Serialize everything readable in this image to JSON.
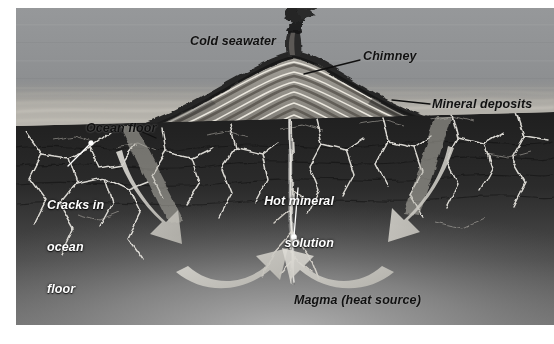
{
  "figure": {
    "kind": "cross-section-diagram",
    "background_color": "#8d8d8d",
    "page_color": "#ffffff"
  },
  "palette": {
    "seawater": "#8f9092",
    "seawater_deep": "#77797c",
    "seafloor_light": "#b9b7b2",
    "rock_dark": "#2c2c2c",
    "rock_mid": "#4a4a4a",
    "magma_glow": "#8a8a8a",
    "crack_white": "#e8e8e4",
    "arrow_fill": "#cfcfca",
    "chimney_smoke": "#1b1b1b",
    "label_dark": "#111111",
    "label_light": "#ffffff"
  },
  "labels": [
    {
      "id": "cold-seawater",
      "text": "Cold seawater",
      "color": "dark",
      "leader": false,
      "lines": [
        "Cold seawater"
      ]
    },
    {
      "id": "chimney",
      "text": "Chimney",
      "color": "dark",
      "leader": true,
      "lines": [
        "Chimney"
      ]
    },
    {
      "id": "mineral-deposits",
      "text": "Mineral deposits",
      "color": "dark",
      "leader": true,
      "lines": [
        "Mineral deposits"
      ]
    },
    {
      "id": "ocean-floor",
      "text": "Ocean floor",
      "color": "dark",
      "leader": true,
      "lines": [
        "Ocean floor"
      ]
    },
    {
      "id": "cracks-in-ocean-floor",
      "text": "Cracks in ocean floor",
      "color": "light",
      "leader": true,
      "lines": [
        "Cracks in",
        "ocean",
        "floor"
      ]
    },
    {
      "id": "hot-mineral-solution",
      "text": "Hot mineral solution",
      "color": "light",
      "leader": true,
      "lines": [
        "Hot mineral",
        "solution"
      ]
    },
    {
      "id": "magma-heat-source",
      "text": "Magma (heat source)",
      "color": "dark",
      "leader": false,
      "lines": [
        "Magma (heat source)"
      ]
    }
  ],
  "label_text": {
    "cold_seawater": "Cold seawater",
    "chimney": "Chimney",
    "mineral_deposits": "Mineral deposits",
    "ocean_floor": "Ocean floor",
    "cracks_line1": "Cracks in",
    "cracks_line2": "ocean",
    "cracks_line3": "floor",
    "hot_mineral_line1": "Hot mineral",
    "hot_mineral_line2": "solution",
    "magma": "Magma (heat source)"
  },
  "flow_arrows": [
    {
      "id": "left-downflow",
      "description": "cold seawater descends into cracks on the left",
      "direction": "down-right"
    },
    {
      "id": "left-upflow",
      "description": "heated solution curves up toward the central vent from the left",
      "direction": "up-right"
    },
    {
      "id": "right-downflow",
      "description": "cold seawater descends into cracks on the right",
      "direction": "down-left"
    },
    {
      "id": "right-upflow",
      "description": "heated solution curves up toward the central vent from the right",
      "direction": "up-left"
    }
  ],
  "features": [
    {
      "id": "smoke-plume",
      "name": "black smoker plume"
    },
    {
      "id": "chimney-stack",
      "name": "chimney stack"
    },
    {
      "id": "vent-mound",
      "name": "layered mineral deposit mound"
    },
    {
      "id": "ocean-floor-surface",
      "name": "ocean floor surface"
    },
    {
      "id": "crust-rock",
      "name": "fractured crustal rock"
    },
    {
      "id": "magma-chamber",
      "name": "magma heat source"
    },
    {
      "id": "central-conduit",
      "name": "central hot fluid conduit"
    }
  ]
}
